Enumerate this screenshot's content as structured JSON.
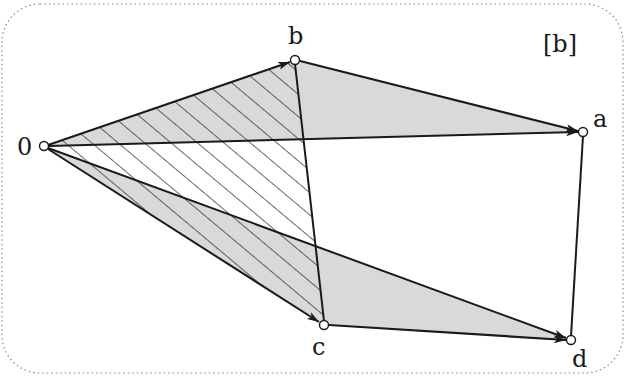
{
  "figure": {
    "panel_label": "[b]",
    "colors": {
      "background": "#ffffff",
      "shade": "#d9d9d9",
      "line": "#1a1a1a",
      "border": "#8a8a8a"
    },
    "points": {
      "origin": {
        "label": "0",
        "x": 44,
        "y": 146
      },
      "b": {
        "label": "b",
        "x": 295,
        "y": 60
      },
      "a": {
        "label": "a",
        "x": 583,
        "y": 132
      },
      "c": {
        "label": "c",
        "x": 324,
        "y": 325
      },
      "d": {
        "label": "d",
        "x": 571,
        "y": 340
      }
    },
    "shaded_triangles": [
      [
        "origin",
        "b",
        "a"
      ],
      [
        "origin",
        "c",
        "d"
      ]
    ],
    "hatched_triangle": [
      "origin",
      "b",
      "c"
    ],
    "arrows": [
      [
        "origin",
        "b"
      ],
      [
        "origin",
        "a"
      ],
      [
        "origin",
        "c"
      ],
      [
        "origin",
        "d"
      ],
      [
        "b",
        "a"
      ],
      [
        "c",
        "d"
      ]
    ],
    "segments": [
      [
        "b",
        "c"
      ],
      [
        "a",
        "d"
      ]
    ]
  }
}
